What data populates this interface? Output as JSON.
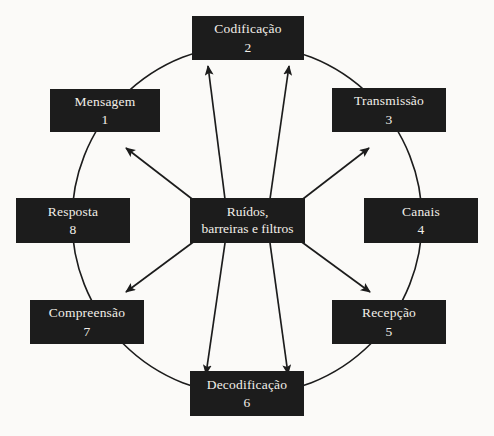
{
  "diagram": {
    "background_color": "#fbfaf8",
    "box_fill_color": "#1c1c1c",
    "box_text_color": "#f2efe9",
    "stroke_color": "#1c1c1c",
    "center": {
      "line1": "Ruídos,",
      "line2": "barreiras e filtros"
    },
    "nodes": [
      {
        "label": "Mensagem",
        "number": "1",
        "angle_deg": 225
      },
      {
        "label": "Codificação",
        "number": "2",
        "angle_deg": 270
      },
      {
        "label": "Transmissão",
        "number": "3",
        "angle_deg": 315
      },
      {
        "label": "Canais",
        "number": "4",
        "angle_deg": 0
      },
      {
        "label": "Recepção",
        "number": "5",
        "angle_deg": 45
      },
      {
        "label": "Decodificação",
        "number": "6",
        "angle_deg": 90
      },
      {
        "label": "Compreensão",
        "number": "7",
        "angle_deg": 135
      },
      {
        "label": "Resposta",
        "number": "8",
        "angle_deg": 180
      }
    ]
  }
}
